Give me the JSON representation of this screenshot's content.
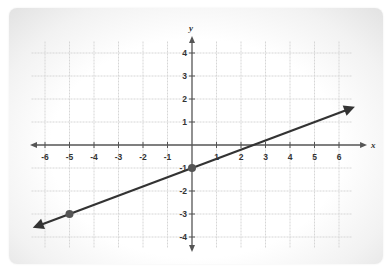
{
  "chart_data": {
    "type": "line",
    "title": "",
    "xlabel": "x",
    "ylabel": "y",
    "xlim": [
      -6.5,
      6.5
    ],
    "ylim": [
      -4.5,
      4.5
    ],
    "grid": true,
    "x_ticks": [
      -6,
      -5,
      -4,
      -3,
      -2,
      -1,
      1,
      2,
      3,
      4,
      5,
      6
    ],
    "y_ticks": [
      4,
      3,
      2,
      1,
      -1,
      -2,
      -3,
      -4
    ],
    "x_tick_labels": [
      "-6",
      "-5",
      "-4",
      "-3",
      "-2",
      "-1",
      "1",
      "2",
      "3",
      "4",
      "5",
      "6"
    ],
    "y_tick_labels": [
      "4",
      "3",
      "2",
      "1",
      "-1",
      "-2",
      "-3",
      "-4"
    ],
    "series": [
      {
        "name": "line",
        "equation": "y = 0.4x - 1",
        "slope": 0.4,
        "intercept": -1,
        "arrows_both_ends": true,
        "x_range": [
          -6.5,
          6.65
        ],
        "color": "#333333"
      }
    ],
    "points": [
      {
        "x": 0,
        "y": -1
      },
      {
        "x": -5,
        "y": -3
      }
    ],
    "colors": {
      "axis": "#555555",
      "grid": "#d6d6d6",
      "line": "#333333",
      "point": "#555555"
    }
  }
}
